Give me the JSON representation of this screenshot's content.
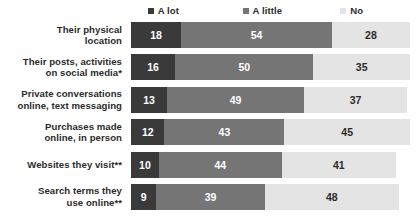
{
  "chart_data": {
    "type": "bar",
    "subtype": "stacked-horizontal-100",
    "title": "",
    "subtitle": "",
    "xlabel": "",
    "ylabel": "",
    "xlim": [
      0,
      100
    ],
    "grid": false,
    "legend_position": "top",
    "categories": [
      "Their physical location",
      "Their posts, activities on social media*",
      "Private conversations online, text messaging",
      "Purchases made online, in person",
      "Websites they visit**",
      "Search terms they use online**"
    ],
    "series": [
      {
        "name": "A lot",
        "color": "#3a3a3a",
        "values": [
          18,
          16,
          13,
          12,
          10,
          9
        ]
      },
      {
        "name": "A little",
        "color": "#757575",
        "values": [
          54,
          50,
          49,
          43,
          44,
          39
        ]
      },
      {
        "name": "No",
        "color": "#e4e4e4",
        "values": [
          28,
          35,
          37,
          45,
          41,
          48
        ]
      }
    ]
  },
  "legend": {
    "items": [
      {
        "label": "A lot",
        "color": "#3a3a3a",
        "left_pct": 6
      },
      {
        "label": "A little",
        "color": "#757575",
        "left_pct": 40
      },
      {
        "label": "No",
        "color": "#e4e4e4",
        "left_pct": 75
      }
    ]
  },
  "rows": [
    {
      "label_lines": [
        "Their physical",
        "location"
      ],
      "a_lot": 18,
      "a_little": 54,
      "no": 28,
      "a_lot_text": "18",
      "a_little_text": "54",
      "no_text": "28"
    },
    {
      "label_lines": [
        "Their posts, activities",
        "on social media*"
      ],
      "a_lot": 16,
      "a_little": 50,
      "no": 35,
      "a_lot_text": "16",
      "a_little_text": "50",
      "no_text": "35"
    },
    {
      "label_lines": [
        "Private conversations",
        "online, text messaging"
      ],
      "a_lot": 13,
      "a_little": 49,
      "no": 37,
      "a_lot_text": "13",
      "a_little_text": "49",
      "no_text": "37"
    },
    {
      "label_lines": [
        "Purchases made",
        "online, in person"
      ],
      "a_lot": 12,
      "a_little": 43,
      "no": 45,
      "a_lot_text": "12",
      "a_little_text": "43",
      "no_text": "45"
    },
    {
      "label_lines": [
        "Websites they visit**"
      ],
      "a_lot": 10,
      "a_little": 44,
      "no": 41,
      "a_lot_text": "10",
      "a_little_text": "44",
      "no_text": "41"
    },
    {
      "label_lines": [
        "Search terms they",
        "use online**"
      ],
      "a_lot": 9,
      "a_little": 39,
      "no": 48,
      "a_lot_text": "9",
      "a_little_text": "39",
      "no_text": "48"
    }
  ],
  "colors": {
    "a_lot": "#3a3a3a",
    "a_little": "#757575",
    "no": "#e4e4e4",
    "text_dark": "#2b2b2b",
    "text_light": "#ffffff",
    "background": "#ffffff"
  }
}
